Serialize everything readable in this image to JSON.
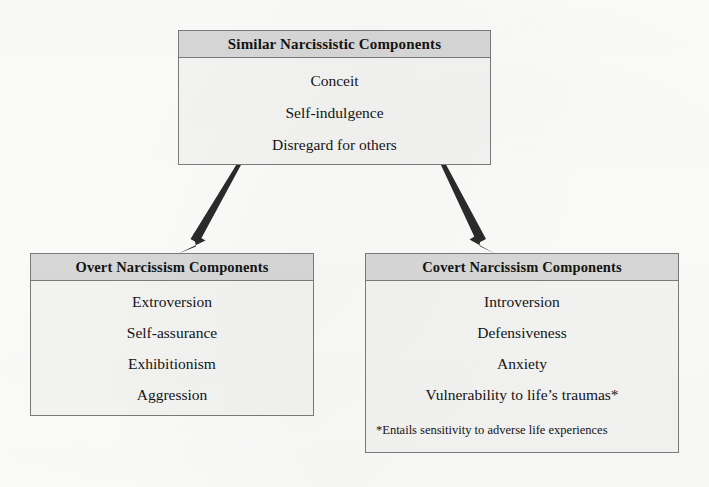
{
  "diagram": {
    "title_present": false,
    "colors": {
      "page_background": "#fdfdfc",
      "node_header_fill": "#d9d9d9",
      "node_body_fill": "#f6f6f4",
      "node_border": "#7b7b7b",
      "arrow": "#2b2b2b",
      "text": "#141414"
    },
    "nodes": {
      "similar": {
        "header": "Similar Narcissistic Components",
        "items": [
          "Conceit",
          "Self-indulgence",
          "Disregard for others"
        ]
      },
      "overt": {
        "header": "Overt Narcissism Components",
        "items": [
          "Extroversion",
          "Self-assurance",
          "Exhibitionism",
          "Aggression"
        ]
      },
      "covert": {
        "header": "Covert Narcissism Components",
        "items": [
          "Introversion",
          "Defensiveness",
          "Anxiety",
          "Vulnerability to life’s traumas*"
        ],
        "note": "*Entails sensitivity to adverse life experiences"
      }
    },
    "connectors": [
      {
        "name": "arrow-similar-to-overt",
        "from": "similar",
        "to": "overt",
        "direction": "down-left"
      },
      {
        "name": "arrow-similar-to-covert",
        "from": "similar",
        "to": "covert",
        "direction": "down-right"
      }
    ]
  }
}
